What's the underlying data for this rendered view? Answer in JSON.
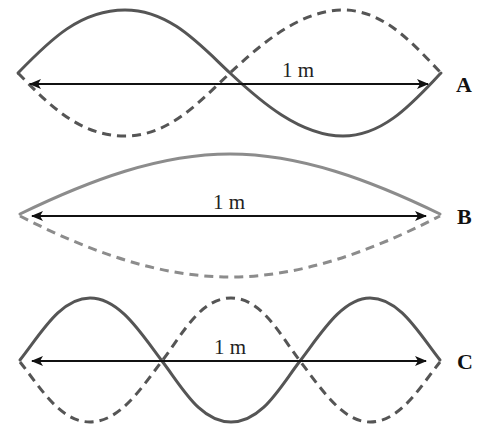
{
  "diagram": {
    "colors": {
      "wave_dark": "#555555",
      "wave_light": "#8c8c8c",
      "arrow": "#111111",
      "text": "#111111"
    },
    "panels": [
      {
        "id": "A",
        "label": "A",
        "length_label": "1 m",
        "loops": 2,
        "description": "Second harmonic: two loops, one node at center"
      },
      {
        "id": "B",
        "label": "B",
        "length_label": "1 m",
        "loops": 1,
        "description": "Fundamental: single loop"
      },
      {
        "id": "C",
        "label": "C",
        "length_label": "1 m",
        "loops": 3,
        "description": "Third harmonic: three loops, two interior nodes"
      }
    ]
  }
}
